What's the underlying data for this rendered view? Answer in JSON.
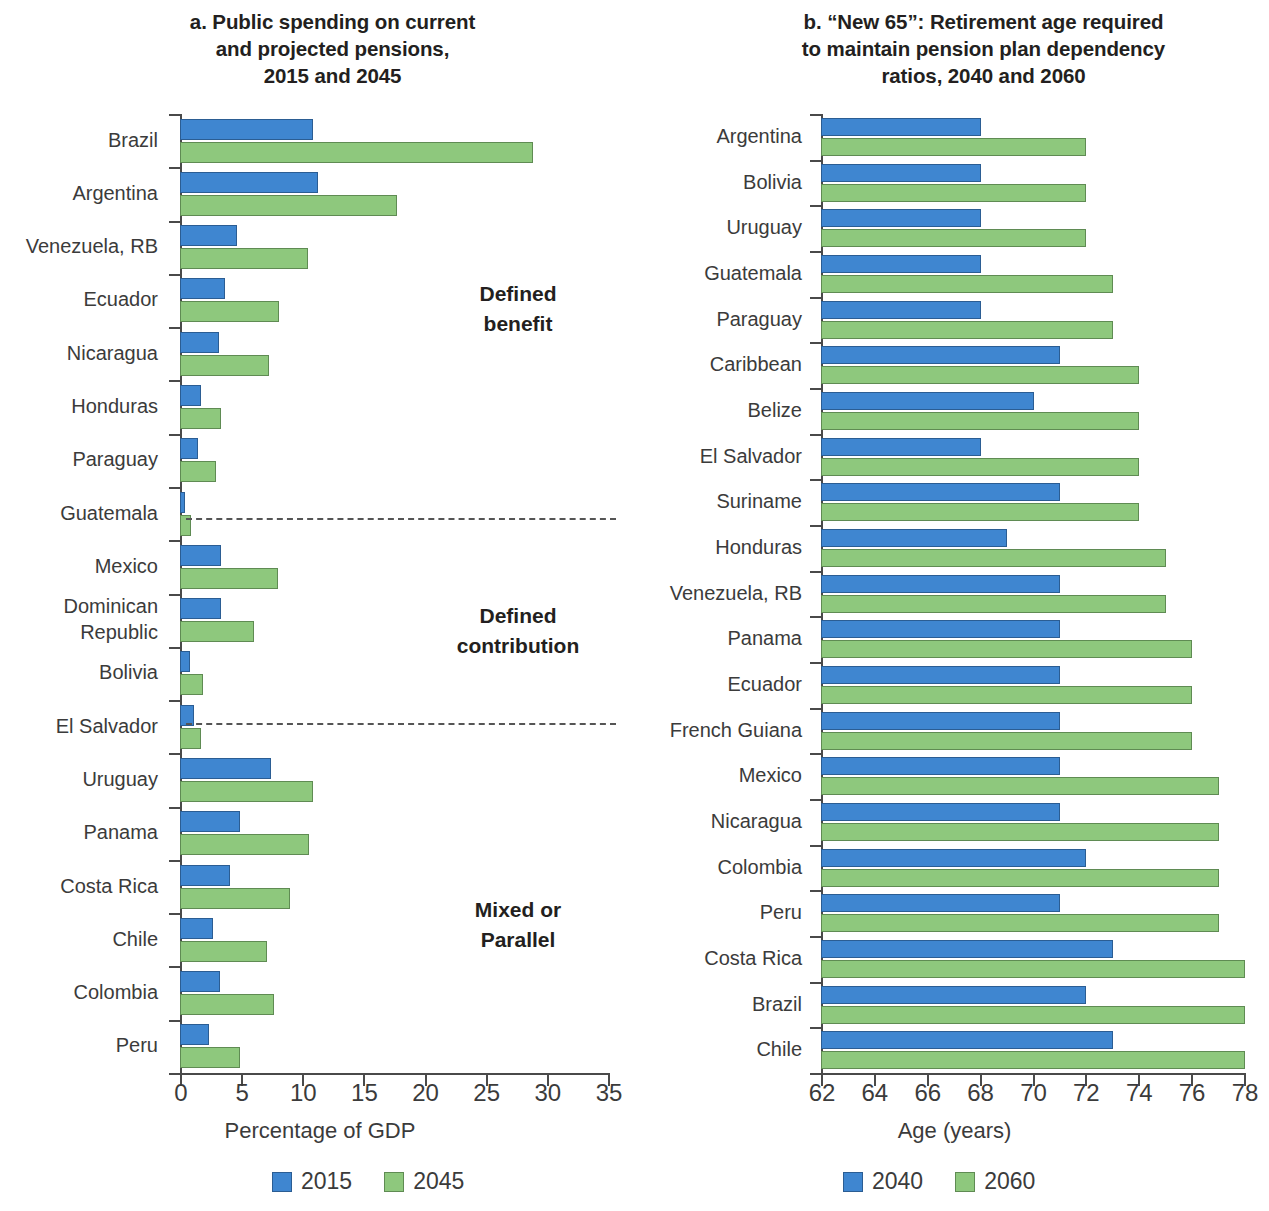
{
  "figure": {
    "background": "#ffffff",
    "series_colors": {
      "first": "#3f86d0",
      "second": "#8ec87d"
    }
  },
  "panel_a": {
    "title": "a. Public spending on current and projected pensions, 2015 and 2045",
    "title_lines": [
      "a. Public spending on current",
      "and projected pensions,",
      "2015 and 2045"
    ],
    "xlabel": "Percentage of GDP",
    "tick_labels": [
      "0",
      "5",
      "10",
      "15",
      "20",
      "25",
      "30",
      "35"
    ],
    "legend": [
      {
        "label": "2015",
        "color": "#3f86d0"
      },
      {
        "label": "2045",
        "color": "#8ec87d"
      }
    ],
    "group_notes": [
      {
        "lines": [
          "Defined",
          "benefit"
        ]
      },
      {
        "lines": [
          "Defined",
          "contribution"
        ]
      },
      {
        "lines": [
          "Mixed or",
          "Parallel"
        ]
      }
    ]
  },
  "panel_b": {
    "title": "b. “New 65”: Retirement age required to maintain pension plan dependency ratios, 2040 and 2060",
    "title_lines": [
      "b. “New 65”: Retirement age required",
      "to maintain pension plan dependency",
      "ratios, 2040 and 2060"
    ],
    "xlabel": "Age (years)",
    "tick_labels": [
      "62",
      "64",
      "66",
      "68",
      "70",
      "72",
      "74",
      "76",
      "78"
    ],
    "legend": [
      {
        "label": "2040",
        "color": "#3f86d0"
      },
      {
        "label": "2060",
        "color": "#8ec87d"
      }
    ]
  },
  "chart_data": [
    {
      "type": "bar",
      "orientation": "horizontal",
      "panel": "a",
      "title": "a. Public spending on current and projected pensions, 2015 and 2045",
      "xlabel": "Percentage of GDP",
      "ylabel": "",
      "xlim": [
        0,
        35
      ],
      "xticks": [
        0,
        5,
        10,
        15,
        20,
        25,
        30,
        35
      ],
      "grid": false,
      "legend_position": "bottom",
      "categories": [
        "Brazil",
        "Argentina",
        "Venezuela, RB",
        "Ecuador",
        "Nicaragua",
        "Honduras",
        "Paraguay",
        "Guatemala",
        "Mexico",
        "Dominican Republic",
        "Bolivia",
        "El Salvador",
        "Uruguay",
        "Panama",
        "Costa Rica",
        "Chile",
        "Colombia",
        "Peru"
      ],
      "series": [
        {
          "name": "2015",
          "color": "#3f86d0",
          "values": [
            10.8,
            11.2,
            4.6,
            3.6,
            3.1,
            1.6,
            1.4,
            0.3,
            3.3,
            3.3,
            0.7,
            1.1,
            7.4,
            4.8,
            4.0,
            2.6,
            3.2,
            2.3
          ]
        },
        {
          "name": "2045",
          "color": "#8ec87d",
          "values": [
            28.8,
            17.7,
            10.4,
            8.0,
            7.2,
            3.3,
            2.9,
            0.8,
            7.9,
            6.0,
            1.8,
            1.6,
            10.8,
            10.5,
            8.9,
            7.0,
            7.6,
            4.8
          ]
        }
      ],
      "annotations": [
        {
          "text": "Defined benefit",
          "applies_to": [
            "Brazil",
            "Argentina",
            "Venezuela, RB",
            "Ecuador",
            "Nicaragua",
            "Honduras",
            "Paraguay",
            "Guatemala"
          ]
        },
        {
          "text": "Defined contribution",
          "applies_to": [
            "Mexico",
            "Dominican Republic",
            "Bolivia",
            "El Salvador"
          ]
        },
        {
          "text": "Mixed or Parallel",
          "applies_to": [
            "Uruguay",
            "Panama",
            "Costa Rica",
            "Chile",
            "Colombia",
            "Peru"
          ]
        }
      ]
    },
    {
      "type": "bar",
      "orientation": "horizontal",
      "panel": "b",
      "title": "b. “New 65”: Retirement age required to maintain pension plan dependency ratios, 2040 and 2060",
      "xlabel": "Age (years)",
      "ylabel": "",
      "xlim": [
        62,
        78
      ],
      "xticks": [
        62,
        64,
        66,
        68,
        70,
        72,
        74,
        76,
        78
      ],
      "grid": false,
      "legend_position": "bottom",
      "categories": [
        "Argentina",
        "Bolivia",
        "Uruguay",
        "Guatemala",
        "Paraguay",
        "Caribbean",
        "Belize",
        "El Salvador",
        "Suriname",
        "Honduras",
        "Venezuela, RB",
        "Panama",
        "Ecuador",
        "French Guiana",
        "Mexico",
        "Nicaragua",
        "Colombia",
        "Peru",
        "Costa Rica",
        "Brazil",
        "Chile"
      ],
      "series": [
        {
          "name": "2040",
          "color": "#3f86d0",
          "values": [
            68,
            68,
            68,
            68,
            68,
            71,
            70,
            68,
            71,
            69,
            71,
            71,
            71,
            71,
            71,
            71,
            72,
            71,
            73,
            72,
            73
          ]
        },
        {
          "name": "2060",
          "color": "#8ec87d",
          "values": [
            72,
            72,
            72,
            73,
            73,
            74,
            74,
            74,
            74,
            75,
            75,
            76,
            76,
            76,
            77,
            77,
            77,
            77,
            78,
            78,
            78
          ]
        }
      ]
    }
  ]
}
